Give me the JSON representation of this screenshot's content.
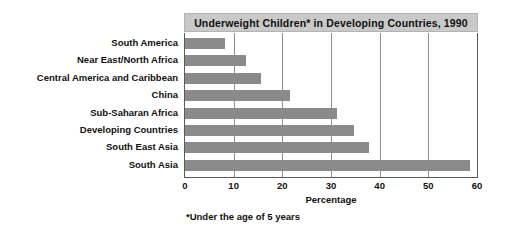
{
  "chart_data": {
    "type": "bar",
    "orientation": "horizontal",
    "title": "Underweight Children* in Developing Countries, 1990",
    "categories": [
      "South America",
      "Near East/North Africa",
      "Central America and Caribbean",
      "China",
      "Sub-Saharan Africa",
      "Developing Countries",
      "South East Asia",
      "South Asia"
    ],
    "values": [
      8.3,
      12.5,
      15.7,
      21.5,
      31.2,
      34.8,
      37.8,
      58.5
    ],
    "xlabel": "Percentage",
    "ylabel": "",
    "xlim": [
      0,
      60
    ],
    "xticks": [
      0,
      10,
      20,
      30,
      40,
      50,
      60
    ],
    "xtick_labels": [
      "0",
      "10",
      "20",
      "30",
      "40",
      "50",
      "60"
    ],
    "grid": "vertical",
    "legend": "none",
    "footnote": "*Under the age of 5 years",
    "bar_color": "#8a8a8a",
    "title_band_color": "#c9c9c9",
    "axis_color": "#5a5a5a",
    "gridline_color": "#8f8f8f",
    "background_color": "#ffffff"
  }
}
